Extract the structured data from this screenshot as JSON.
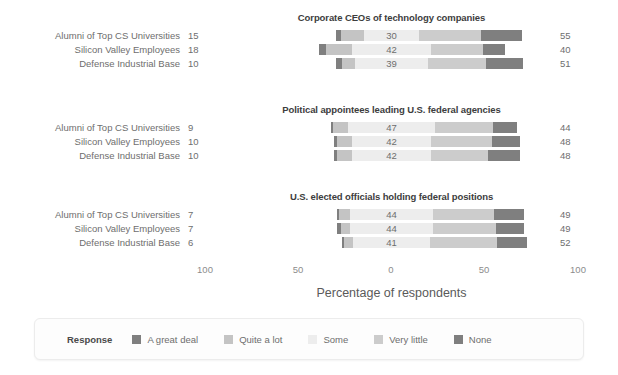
{
  "chart_data": {
    "type": "bar",
    "subtype": "diverging-stacked-likert",
    "title": "",
    "xlabel": "Percentage of respondents",
    "ylabel": "",
    "xlim": [
      -100,
      100
    ],
    "xticks": [
      -100,
      -50,
      0,
      50,
      100
    ],
    "xticklabels": [
      "100",
      "50",
      "0",
      "50",
      "100"
    ],
    "grid": false,
    "legend": {
      "title": "Response",
      "position": "bottom",
      "entries": [
        {
          "label": "A great deal",
          "color": "#7f7f7f"
        },
        {
          "label": "Quite a lot",
          "color": "#c4c4c4"
        },
        {
          "label": "Some",
          "color": "#ededed"
        },
        {
          "label": "Very little",
          "color": "#cccccc"
        },
        {
          "label": "None",
          "color": "#7f7f7f"
        }
      ]
    },
    "categories": [
      "Alumni of Top CS Universities",
      "Silicon Valley Employees",
      "Defense Industrial Base"
    ],
    "panels": [
      {
        "title": "Corporate CEOs of technology companies",
        "rows": [
          {
            "label": "Alumni of Top CS Universities",
            "left_total": "15",
            "center_value": "30",
            "right_total": "55",
            "values": {
              "a_great_deal": 3,
              "quite_a_lot": 12,
              "some": 30,
              "very_little": 33,
              "none": 22
            }
          },
          {
            "label": "Silicon Valley Employees",
            "left_total": "18",
            "center_value": "42",
            "right_total": "40",
            "values": {
              "a_great_deal": 4,
              "quite_a_lot": 14,
              "some": 42,
              "very_little": 28,
              "none": 12
            }
          },
          {
            "label": "Defense Industrial Base",
            "left_total": "10",
            "center_value": "39",
            "right_total": "51",
            "values": {
              "a_great_deal": 3,
              "quite_a_lot": 7,
              "some": 39,
              "very_little": 31,
              "none": 20
            }
          }
        ]
      },
      {
        "title": "Political appointees leading U.S. federal agencies",
        "rows": [
          {
            "label": "Alumni of Top CS Universities",
            "left_total": "9",
            "center_value": "47",
            "right_total": "44",
            "values": {
              "a_great_deal": 1,
              "quite_a_lot": 8,
              "some": 47,
              "very_little": 31,
              "none": 13
            }
          },
          {
            "label": "Silicon Valley Employees",
            "left_total": "10",
            "center_value": "42",
            "right_total": "48",
            "values": {
              "a_great_deal": 2,
              "quite_a_lot": 8,
              "some": 42,
              "very_little": 33,
              "none": 15
            }
          },
          {
            "label": "Defense Industrial Base",
            "left_total": "10",
            "center_value": "42",
            "right_total": "48",
            "values": {
              "a_great_deal": 2,
              "quite_a_lot": 8,
              "some": 42,
              "very_little": 31,
              "none": 17
            }
          }
        ]
      },
      {
        "title": "U.S. elected officials holding federal positions",
        "rows": [
          {
            "label": "Alumni of Top CS Universities",
            "left_total": "7",
            "center_value": "44",
            "right_total": "49",
            "values": {
              "a_great_deal": 1,
              "quite_a_lot": 6,
              "some": 44,
              "very_little": 33,
              "none": 16
            }
          },
          {
            "label": "Silicon Valley Employees",
            "left_total": "7",
            "center_value": "44",
            "right_total": "49",
            "values": {
              "a_great_deal": 2,
              "quite_a_lot": 5,
              "some": 44,
              "very_little": 34,
              "none": 15
            }
          },
          {
            "label": "Defense Industrial Base",
            "left_total": "6",
            "center_value": "41",
            "right_total": "52",
            "values": {
              "a_great_deal": 1,
              "quite_a_lot": 5,
              "some": 41,
              "very_little": 36,
              "none": 16
            }
          }
        ]
      }
    ]
  }
}
